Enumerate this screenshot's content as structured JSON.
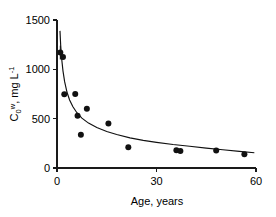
{
  "chart_data": {
    "type": "scatter",
    "title": "",
    "subtitle": "",
    "xlabel": "Age, years",
    "ylabel": "C₀, w mg L⁻¹",
    "ylabel_parts": {
      "base": "C",
      "subscript": "0",
      "superscript": "w",
      "rest": ", mg L",
      "rest_superscript": "-1"
    },
    "xlim": [
      0,
      60
    ],
    "ylim": [
      0,
      1500
    ],
    "xticks": [
      0,
      30,
      60
    ],
    "xtick_labels": [
      "0",
      "30",
      "60"
    ],
    "yticks": [
      0,
      500,
      1000,
      1500
    ],
    "ytick_labels": [
      "0",
      "500",
      "1000",
      "1500"
    ],
    "grid": false,
    "legend": null,
    "legend_position": "none",
    "marker": "filled-circle",
    "marker_color": "#111111",
    "curve_color": "#111111",
    "axis_color": "#1a1a1a",
    "points": [
      {
        "x": 1.0,
        "y": 1170,
        "yerr": 70
      },
      {
        "x": 1.8,
        "y": 1125
      },
      {
        "x": 2.2,
        "y": 748
      },
      {
        "x": 5.5,
        "y": 750
      },
      {
        "x": 6.2,
        "y": 530
      },
      {
        "x": 9.0,
        "y": 600
      },
      {
        "x": 7.2,
        "y": 338
      },
      {
        "x": 15.5,
        "y": 450
      },
      {
        "x": 21.5,
        "y": 210
      },
      {
        "x": 36.0,
        "y": 180
      },
      {
        "x": 37.2,
        "y": 172
      },
      {
        "x": 48.0,
        "y": 178
      },
      {
        "x": 56.5,
        "y": 140
      }
    ],
    "fit_curve": {
      "description": "decaying power-law fit through the data",
      "form": "power-law decay",
      "samples": [
        {
          "x": 0.9,
          "y": 1390
        },
        {
          "x": 1.1,
          "y": 1250
        },
        {
          "x": 1.4,
          "y": 1110
        },
        {
          "x": 1.8,
          "y": 985
        },
        {
          "x": 2.3,
          "y": 875
        },
        {
          "x": 3.0,
          "y": 770
        },
        {
          "x": 3.8,
          "y": 690
        },
        {
          "x": 4.8,
          "y": 620
        },
        {
          "x": 6.0,
          "y": 560
        },
        {
          "x": 7.5,
          "y": 505
        },
        {
          "x": 9.5,
          "y": 455
        },
        {
          "x": 12.0,
          "y": 410
        },
        {
          "x": 15.0,
          "y": 370
        },
        {
          "x": 18.0,
          "y": 340
        },
        {
          "x": 22.0,
          "y": 305
        },
        {
          "x": 26.0,
          "y": 280
        },
        {
          "x": 30.0,
          "y": 260
        },
        {
          "x": 35.0,
          "y": 238
        },
        {
          "x": 40.0,
          "y": 220
        },
        {
          "x": 45.0,
          "y": 202
        },
        {
          "x": 50.0,
          "y": 185
        },
        {
          "x": 55.0,
          "y": 168
        },
        {
          "x": 59.5,
          "y": 155
        }
      ]
    }
  }
}
